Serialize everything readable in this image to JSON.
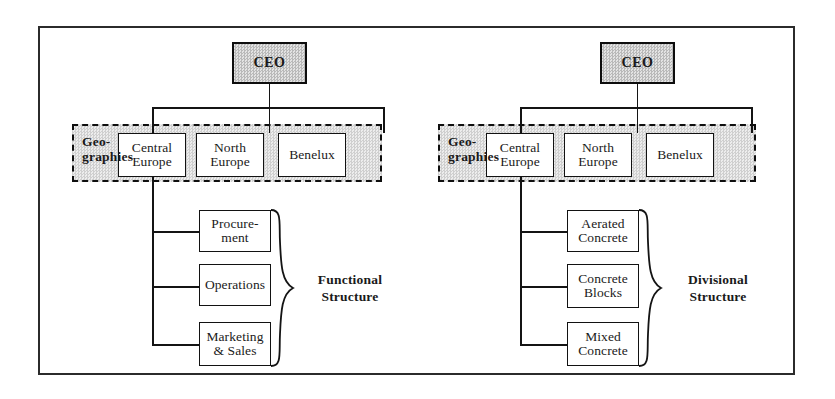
{
  "figure": {
    "type": "organizational-structure-comparison",
    "panels": [
      {
        "id": "functional",
        "root": {
          "label": "CEO"
        },
        "band_label_line1": "Geo-",
        "band_label_line2": "graphies",
        "geographies": [
          {
            "line1": "Central",
            "line2": "Europe"
          },
          {
            "line1": "North",
            "line2": "Europe"
          },
          {
            "line1": "Benelux",
            "line2": ""
          }
        ],
        "units": [
          {
            "line1": "Procure-",
            "line2": "ment"
          },
          {
            "line1": "Operations",
            "line2": ""
          },
          {
            "line1": "Marketing",
            "line2": "& Sales"
          }
        ],
        "structure_label_line1": "Functional",
        "structure_label_line2": "Structure"
      },
      {
        "id": "divisional",
        "root": {
          "label": "CEO"
        },
        "band_label_line1": "Geo-",
        "band_label_line2": "graphies",
        "geographies": [
          {
            "line1": "Central",
            "line2": "Europe"
          },
          {
            "line1": "North",
            "line2": "Europe"
          },
          {
            "line1": "Benelux",
            "line2": ""
          }
        ],
        "units": [
          {
            "line1": "Aerated",
            "line2": "Concrete"
          },
          {
            "line1": "Concrete",
            "line2": "Blocks"
          },
          {
            "line1": "Mixed",
            "line2": "Concrete"
          }
        ],
        "structure_label_line1": "Divisional",
        "structure_label_line2": "Structure"
      }
    ],
    "colors": {
      "line": "#141414",
      "box_fill": "#ffffff",
      "ceo_fill": "#d4d4d4",
      "band_fill": "#e0e0e0",
      "frame": "#2b2b2b"
    }
  }
}
